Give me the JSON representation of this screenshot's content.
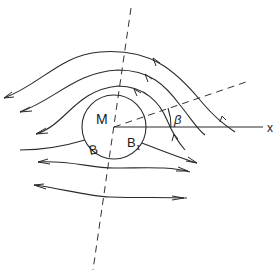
{
  "diagram": {
    "type": "flow-around-cylinder",
    "labels": {
      "center": "M",
      "point_left": "B",
      "point_right_main": "B",
      "point_right_sub": "1",
      "angle": "β",
      "x_axis": "x"
    },
    "elements": {
      "circle": {
        "cx": 114,
        "cy": 127,
        "r": 32
      },
      "dashed_axis_vertical": {
        "from": [
          131,
          8
        ],
        "to": [
          93,
          270
        ]
      },
      "dashed_axis_tilted": {
        "from": [
          114,
          127
        ],
        "to": [
          246,
          82
        ]
      },
      "x_axis": {
        "from": [
          114,
          127
        ],
        "to": [
          263,
          127
        ]
      },
      "streamlines_count": 7,
      "flow_direction": "right-to-left"
    },
    "colors": {
      "line": "#2a2a2a",
      "background": "#ffffff"
    }
  }
}
